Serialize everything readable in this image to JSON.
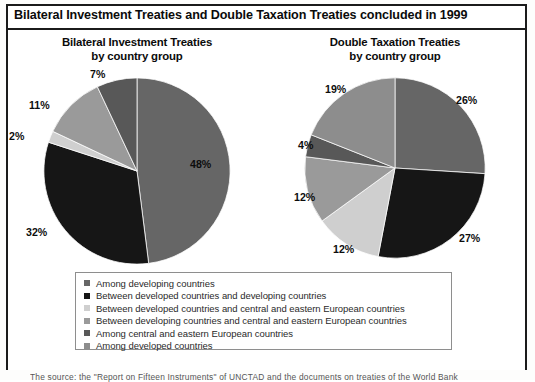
{
  "document": {
    "title": "Bilateral Investment Treaties and Double Taxation Treaties concluded in 1999",
    "footnote": "The source: the \"Report on Fifteen Instruments\" of UNCTAD and the documents on treaties of the World Bank"
  },
  "colors": {
    "among_developing": "#666666",
    "developed_developing": "#161616",
    "developed_cee": "#cfcfcf",
    "developing_cee": "#9a9a9a",
    "among_cee": "#585858",
    "among_developed": "#8d8d8d",
    "text": "#0d0d0d",
    "frame": "#1b1b1b",
    "legend_border": "#8e8e8e"
  },
  "legend": {
    "items": [
      {
        "label": "Among developing countries",
        "color": "#666666",
        "key": "among-developing-countries"
      },
      {
        "label": "Between developed countries and developing countries",
        "color": "#161616",
        "key": "between-developed-and-developing-countries"
      },
      {
        "label": "Between developed countries and central and eastern European countries",
        "color": "#cfcfcf",
        "key": "between-developed-and-cee-countries"
      },
      {
        "label": "Between developing countries and central and eastern European countries",
        "color": "#9a9a9a",
        "key": "between-developing-and-cee-countries"
      },
      {
        "label": "Among central and eastern European countries",
        "color": "#585858",
        "key": "among-cee-countries"
      },
      {
        "label": "Among developed countries",
        "color": "#8d8d8d",
        "key": "among-developed-countries"
      }
    ]
  },
  "chart_data": [
    {
      "type": "pie",
      "id": "bilateral-investment-treaties",
      "title": "Bilateral Investment Treaties\nby country group",
      "title_line1": "Bilateral Investment Treaties",
      "title_line2": "by country group",
      "unit": "percent",
      "start_angle": 0,
      "direction": "clockwise",
      "categories": [
        "Among developing countries",
        "Between developed countries and developing countries",
        "Between developed countries and central and eastern European countries",
        "Between developing countries and central and eastern European countries",
        "Among central and eastern European countries"
      ],
      "values": [
        48,
        32,
        2,
        11,
        7
      ],
      "labels": [
        "48%",
        "32%",
        "2%",
        "11%",
        "7%"
      ],
      "slice_colors": [
        "#666666",
        "#161616",
        "#cfcfcf",
        "#9a9a9a",
        "#585858"
      ],
      "legend_position": "bottom-shared"
    },
    {
      "type": "pie",
      "id": "double-taxation-treaties",
      "title": "Double Taxation Treaties\nby country group",
      "title_line1": "Double Taxation Treaties",
      "title_line2": "by country group",
      "unit": "percent",
      "start_angle": 0,
      "direction": "clockwise",
      "categories": [
        "Among developing countries",
        "Between developed countries and developing countries",
        "Between developed countries and central and eastern European countries",
        "Between developing countries and central and eastern European countries",
        "Among central and eastern European countries",
        "Among developed countries"
      ],
      "values": [
        26,
        27,
        12,
        12,
        4,
        19
      ],
      "labels": [
        "26%",
        "27%",
        "12%",
        "12%",
        "4%",
        "19%"
      ],
      "slice_colors": [
        "#666666",
        "#161616",
        "#cfcfcf",
        "#9a9a9a",
        "#585858",
        "#8d8d8d"
      ],
      "legend_position": "bottom-shared"
    }
  ]
}
